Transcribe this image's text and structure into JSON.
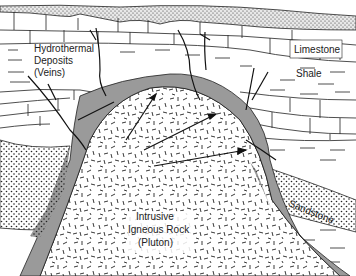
{
  "diagram": {
    "labels": {
      "veins_line1": "Hydrothermal",
      "veins_line2": "Deposits",
      "veins_line3": "(Veins)",
      "limestone": "Limestone",
      "shale": "Shale",
      "sandstone": "Sandstone",
      "pluton_line1": "Intrusive",
      "pluton_line2": "Igneous Rock",
      "pluton_line3": "(Pluton)"
    },
    "layers": [
      {
        "name": "Surface sediment",
        "pattern": "stipple"
      },
      {
        "name": "Limestone",
        "pattern": "brick"
      },
      {
        "name": "Shale",
        "pattern": "dashes"
      },
      {
        "name": "Limestone (lower)",
        "pattern": "brick"
      },
      {
        "name": "Sandstone",
        "pattern": "dots"
      },
      {
        "name": "Contact aureole",
        "pattern": "gray"
      },
      {
        "name": "Pluton",
        "pattern": "random-dashes"
      }
    ],
    "colors": {
      "ink": "#1a1a1a",
      "aureole": "#9a9a9a",
      "stipple": "#d8d8d8",
      "background": "#ffffff"
    }
  }
}
